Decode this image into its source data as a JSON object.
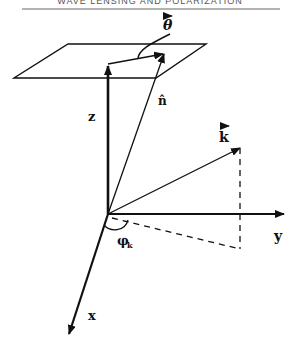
{
  "header": {
    "text": "WAVE LENSING AND POLARIZATION"
  },
  "labels": {
    "theta": "θ",
    "n_hat": "n̂",
    "z": "z",
    "k": "k",
    "y": "y",
    "x": "x",
    "phi": "φ",
    "phi_sub": "k"
  },
  "colors": {
    "ink": "#111111",
    "background": "#ffffff"
  }
}
